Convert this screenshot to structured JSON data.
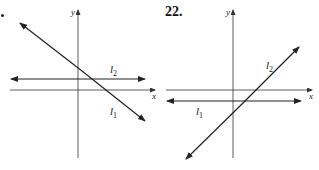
{
  "figures": [
    {
      "number": "",
      "axis_x_label": "x",
      "axis_y_label": "y",
      "lines": [
        {
          "label": "l",
          "sub": "1",
          "description": "decreasing line crossing y-axis above l2"
        },
        {
          "label": "l",
          "sub": "2",
          "description": "horizontal line above x-axis"
        }
      ]
    },
    {
      "number": "22.",
      "axis_x_label": "x",
      "axis_y_label": "y",
      "lines": [
        {
          "label": "l",
          "sub": "1",
          "description": "horizontal line below x-axis"
        },
        {
          "label": "l",
          "sub": "2",
          "description": "increasing line"
        }
      ]
    }
  ],
  "colors": {
    "ink": "#222222",
    "background": "#ffffff"
  }
}
